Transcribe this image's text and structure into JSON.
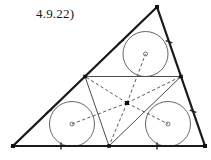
{
  "figure": {
    "label": "4.9.22)",
    "kind": "euclidean-geometry-diagram",
    "width": 211,
    "height": 160,
    "background_color": "#ffffff",
    "stroke_color": "#1a1a1a",
    "thin_stroke_color": "#555555",
    "dashed_stroke_color": "#4a4a4a"
  },
  "outer_triangle": {
    "name": "outer-triangle",
    "stroke_width": 2.2,
    "vertices": [
      {
        "name": "bottom-left-vertex",
        "x": 13,
        "y": 146
      },
      {
        "name": "bottom-right-vertex",
        "x": 205,
        "y": 146
      },
      {
        "name": "apex-vertex",
        "x": 157,
        "y": 7
      }
    ]
  },
  "midpoints": [
    {
      "name": "midpoint-bottom",
      "x": 109,
      "y": 146
    },
    {
      "name": "midpoint-left-side",
      "x": 85,
      "y": 76.5
    },
    {
      "name": "midpoint-right-side",
      "x": 181,
      "y": 76.5
    }
  ],
  "medial_triangle": {
    "name": "medial-triangle",
    "stroke_width": 1.0,
    "vertices": [
      {
        "x": 109,
        "y": 146
      },
      {
        "x": 85,
        "y": 76.5
      },
      {
        "x": 181,
        "y": 76.5
      }
    ]
  },
  "center_point": {
    "name": "center-point",
    "x": 127,
    "y": 103,
    "size": 4
  },
  "incircles": [
    {
      "name": "incircle-top",
      "cx": 145.5,
      "cy": 54,
      "r": 22.5,
      "center_marker_r": 2.0
    },
    {
      "name": "incircle-bottom-left",
      "cx": 72,
      "cy": 124,
      "r": 22.5,
      "center_marker_r": 2.0
    },
    {
      "name": "incircle-bottom-right",
      "cx": 168,
      "cy": 124,
      "r": 22.5,
      "center_marker_r": 2.0
    }
  ],
  "dashed_segments": [
    {
      "name": "dash-center-to-top-circle",
      "x1": 127,
      "y1": 103,
      "x2": 145.5,
      "y2": 54
    },
    {
      "name": "dash-center-to-left-circle",
      "x1": 127,
      "y1": 103,
      "x2": 72,
      "y2": 124
    },
    {
      "name": "dash-center-to-right-circle",
      "x1": 127,
      "y1": 103,
      "x2": 168,
      "y2": 124
    },
    {
      "name": "dash-center-to-midpoint-left",
      "x1": 127,
      "y1": 103,
      "x2": 85,
      "y2": 76.5
    },
    {
      "name": "dash-center-to-midpoint-right",
      "x1": 127,
      "y1": 103,
      "x2": 181,
      "y2": 76.5
    },
    {
      "name": "dash-center-to-midpoint-bottom",
      "x1": 127,
      "y1": 103,
      "x2": 109,
      "y2": 146
    }
  ],
  "tick_marks": [
    {
      "name": "tick-left-side-upper",
      "x": 121,
      "y": 41.7,
      "angle": 60.2
    },
    {
      "name": "tick-left-side-lower",
      "x": 49,
      "y": 111.3,
      "angle": 60.2
    },
    {
      "name": "tick-right-side-upper",
      "x": 169,
      "y": 41.7,
      "angle": -70.9
    },
    {
      "name": "tick-right-side-lower",
      "x": 193,
      "y": 111.3,
      "angle": -70.9
    },
    {
      "name": "tick-bottom-left-half",
      "x": 61,
      "y": 146,
      "angle": 0
    },
    {
      "name": "tick-bottom-right-half",
      "x": 157,
      "y": 146,
      "angle": 0
    }
  ]
}
